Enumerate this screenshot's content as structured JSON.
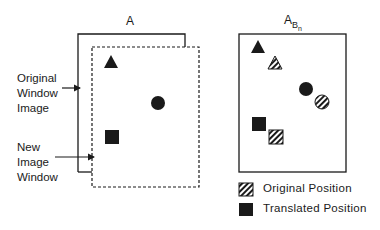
{
  "left_panel": {
    "title": "A",
    "label_original": [
      "Original",
      "Window",
      "Image"
    ],
    "label_new": [
      "New",
      "Image",
      "Window"
    ]
  },
  "right_panel": {
    "title_main": "A",
    "title_sub": "B",
    "title_subsub": "n"
  },
  "legend": {
    "items": [
      {
        "label": "Original Position",
        "pattern": "hatched"
      },
      {
        "label": "Translated Position",
        "pattern": "solid"
      }
    ]
  },
  "colors": {
    "ink": "#1a1a1a",
    "background": "#ffffff"
  }
}
